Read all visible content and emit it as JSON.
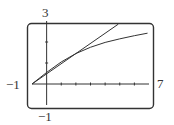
{
  "chart_data": {
    "type": "line",
    "title": "",
    "xlabel": "",
    "ylabel": "",
    "xlim": [
      -1,
      7
    ],
    "ylim": [
      -1,
      3
    ],
    "window_labels": {
      "xmin": "−1",
      "xmax": "7",
      "ymin": "−1",
      "ymax": "3"
    },
    "grid": false,
    "x_ticks": [
      1,
      2,
      3,
      4,
      5,
      6
    ],
    "y_ticks": [
      1,
      2
    ],
    "series": [
      {
        "name": "line",
        "x": [
          -1,
          4.9
        ],
        "y": [
          0,
          2.85
        ]
      },
      {
        "name": "curve",
        "x": [
          -1,
          0,
          1,
          2,
          3,
          4,
          5,
          6,
          6.9
        ],
        "y": [
          0,
          0.55,
          1.05,
          1.45,
          1.75,
          1.98,
          2.15,
          2.3,
          2.42
        ]
      }
    ]
  }
}
